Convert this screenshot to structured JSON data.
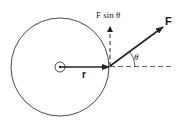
{
  "diagram": {
    "labels": {
      "force": "F",
      "radius": "r",
      "angle": "θ",
      "component": "F sin θ"
    },
    "colors": {
      "stroke": "#222222",
      "background": "#ffffff"
    }
  }
}
